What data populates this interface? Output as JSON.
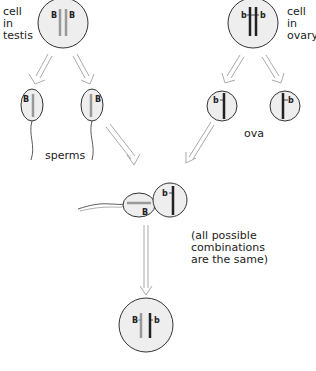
{
  "labels": {
    "testis_cell": [
      "cell",
      "in",
      "testis"
    ],
    "ovary_cell": [
      "cell",
      "in",
      "ovary"
    ],
    "sperms": "sperms",
    "ova": "ova",
    "note": [
      "(all possible",
      "combinations",
      "are the same)"
    ]
  },
  "alleles": {
    "dominant": "B",
    "recessive": "b"
  },
  "colors": {
    "cell_fill": "#eeeeee",
    "cell_stroke": "#333333",
    "paternal_chromosome": "#999999",
    "maternal_chromosome": "#222222",
    "arrow_stroke": "#aaaaaa"
  }
}
